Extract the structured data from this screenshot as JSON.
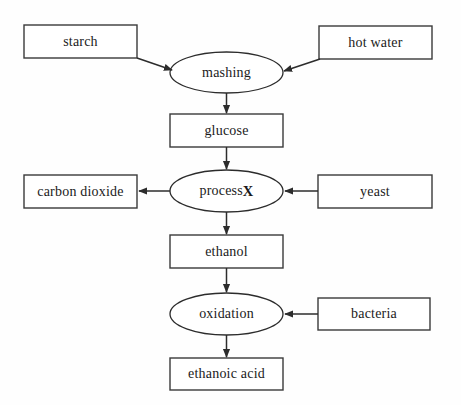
{
  "diagram": {
    "background_color": "#fefefe",
    "stroke_color": "#2c2c2c",
    "text_color": "#1a1a1a",
    "nodes": [
      {
        "id": "starch",
        "label": "starch",
        "shape": "rectangle",
        "x": 24,
        "y": 25,
        "w": 113,
        "h": 33
      },
      {
        "id": "hot_water",
        "label": "hot water",
        "shape": "rectangle",
        "x": 319,
        "y": 26,
        "w": 113,
        "h": 33
      },
      {
        "id": "mashing",
        "label": "mashing",
        "shape": "ellipse",
        "x": 170,
        "y": 52,
        "w": 113,
        "h": 41
      },
      {
        "id": "glucose",
        "label": "glucose",
        "shape": "rectangle",
        "x": 170,
        "y": 114,
        "w": 113,
        "h": 33
      },
      {
        "id": "carbon_dioxide",
        "label": "carbon dioxide",
        "shape": "rectangle",
        "x": 24,
        "y": 175,
        "w": 113,
        "h": 33
      },
      {
        "id": "process_x",
        "label": "process X",
        "shape": "ellipse",
        "x": 170,
        "y": 170,
        "w": 113,
        "h": 42,
        "bold_suffix": "X",
        "plain_prefix": "process "
      },
      {
        "id": "yeast",
        "label": "yeast",
        "shape": "rectangle",
        "x": 318,
        "y": 175,
        "w": 114,
        "h": 33
      },
      {
        "id": "ethanol",
        "label": "ethanol",
        "shape": "rectangle",
        "x": 170,
        "y": 235,
        "w": 113,
        "h": 33
      },
      {
        "id": "oxidation",
        "label": "oxidation",
        "shape": "ellipse",
        "x": 170,
        "y": 293,
        "w": 113,
        "h": 42
      },
      {
        "id": "bacteria",
        "label": "bacteria",
        "shape": "rectangle",
        "x": 318,
        "y": 298,
        "w": 112,
        "h": 32
      },
      {
        "id": "ethanoic_acid",
        "label": "ethanoic acid",
        "shape": "rectangle",
        "x": 170,
        "y": 358,
        "w": 113,
        "h": 32
      }
    ],
    "edges": [
      {
        "id": "starch-to-mashing",
        "from": "starch",
        "to": "mashing",
        "direction": "diagonal-down-right"
      },
      {
        "id": "hot-water-to-mashing",
        "from": "hot_water",
        "to": "mashing",
        "direction": "diagonal-down-left"
      },
      {
        "id": "mashing-to-glucose",
        "from": "mashing",
        "to": "glucose",
        "direction": "down"
      },
      {
        "id": "glucose-to-process-x",
        "from": "glucose",
        "to": "process_x",
        "direction": "down"
      },
      {
        "id": "process-x-to-carbon",
        "from": "process_x",
        "to": "carbon_dioxide",
        "direction": "left"
      },
      {
        "id": "yeast-to-process-x",
        "from": "yeast",
        "to": "process_x",
        "direction": "left"
      },
      {
        "id": "process-x-to-ethanol",
        "from": "process_x",
        "to": "ethanol",
        "direction": "down"
      },
      {
        "id": "ethanol-to-oxidation",
        "from": "ethanol",
        "to": "oxidation",
        "direction": "down"
      },
      {
        "id": "bacteria-to-oxidation",
        "from": "bacteria",
        "to": "oxidation",
        "direction": "left"
      },
      {
        "id": "oxidation-to-ethanoic",
        "from": "oxidation",
        "to": "ethanoic_acid",
        "direction": "down"
      }
    ]
  }
}
